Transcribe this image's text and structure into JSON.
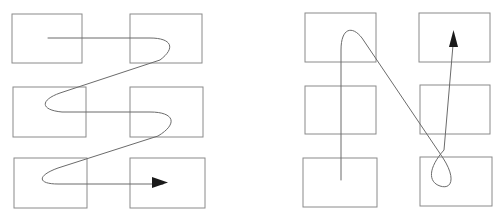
{
  "figure": {
    "title": "",
    "background_color": "#ffffff",
    "width": 503,
    "height": 219,
    "panel_count": 2
  },
  "style": {
    "rect_stroke_color": "#8a8a8a",
    "rect_stroke_width": 1,
    "rect_fill_color": "#ffffff",
    "path_stroke_color": "#6b6b6b",
    "path_stroke_width": 1,
    "arrow_fill_color": "#1a1a1a"
  },
  "panels": [
    {
      "id": "left-panel",
      "name": "horizontal-serpentine-scan",
      "label": "",
      "grid": {
        "rows": 3,
        "cols": 2,
        "cells": [
          {
            "id": "cell-r1c1",
            "row": 1,
            "col": 1,
            "label": "",
            "x": 12,
            "y": 14,
            "w": 70,
            "h": 49
          },
          {
            "id": "cell-r1c2",
            "row": 1,
            "col": 2,
            "label": "",
            "x": 130,
            "y": 14,
            "w": 72,
            "h": 49
          },
          {
            "id": "cell-r2c1",
            "row": 2,
            "col": 1,
            "label": "",
            "x": 13,
            "y": 87,
            "w": 73,
            "h": 50
          },
          {
            "id": "cell-r2c2",
            "row": 2,
            "col": 2,
            "label": "",
            "x": 130,
            "y": 87,
            "w": 73,
            "h": 50
          },
          {
            "id": "cell-r3c1",
            "row": 3,
            "col": 1,
            "label": "",
            "x": 14,
            "y": 158,
            "w": 73,
            "h": 50
          },
          {
            "id": "cell-r3c2",
            "row": 3,
            "col": 2,
            "label": "",
            "x": 130,
            "y": 158,
            "w": 75,
            "h": 50
          }
        ]
      },
      "path": {
        "id": "left-scan-path",
        "start_point": {
          "x": 48,
          "y": 38
        },
        "end_point": {
          "x": 167,
          "y": 182
        },
        "d": "M 48,38 L 150,38 C 172,38 176,48 160,60 L 60,93 C 40,100 40,110 62,112 L 150,112 C 175,112 178,124 158,136 L 58,168 C 36,176 38,184 58,184 L 163,184",
        "has_arrow": true,
        "arrow_direction": "right",
        "arrow_tip": {
          "x": 167,
          "y": 182
        }
      },
      "arrows": [
        {
          "id": "left-arrowhead",
          "name": "path-end-arrowhead",
          "direction": "right",
          "x": 167,
          "y": 182,
          "points": "152,177 168,182.5 152,188"
        }
      ]
    },
    {
      "id": "right-panel",
      "name": "vertical-serpentine-scan",
      "label": "",
      "grid": {
        "rows": 3,
        "cols": 2,
        "cells": [
          {
            "id": "cell-r1c1",
            "row": 1,
            "col": 1,
            "label": "",
            "x": 305,
            "y": 13,
            "w": 71,
            "h": 49
          },
          {
            "id": "cell-r1c2",
            "row": 1,
            "col": 2,
            "label": "",
            "x": 419,
            "y": 13,
            "w": 71,
            "h": 49
          },
          {
            "id": "cell-r2c1",
            "row": 2,
            "col": 1,
            "label": "",
            "x": 305,
            "y": 86,
            "w": 71,
            "h": 48
          },
          {
            "id": "cell-r2c2",
            "row": 2,
            "col": 2,
            "label": "",
            "x": 420,
            "y": 85,
            "w": 70,
            "h": 49
          },
          {
            "id": "cell-r3c1",
            "row": 3,
            "col": 1,
            "label": "",
            "x": 303,
            "y": 158,
            "w": 74,
            "h": 49
          },
          {
            "id": "cell-r3c2",
            "row": 3,
            "col": 2,
            "label": "",
            "x": 420,
            "y": 157,
            "w": 72,
            "h": 49
          }
        ]
      },
      "path": {
        "id": "right-scan-path",
        "start_point": {
          "x": 341,
          "y": 180
        },
        "end_point": {
          "x": 453,
          "y": 31
        },
        "d": "M 341,180 L 341,50 C 341,28 352,25 362,38 L 443,158 C 456,178 452,190 440,186 C 428,182 428,168 444,150 L 453,45",
        "has_arrow": true,
        "arrow_direction": "up",
        "arrow_tip": {
          "x": 453,
          "y": 31
        }
      },
      "arrows": [
        {
          "id": "right-arrowhead",
          "name": "path-end-arrowhead",
          "direction": "up",
          "x": 453,
          "y": 31,
          "points": "449,47 453.5,30 458,47"
        }
      ]
    }
  ]
}
